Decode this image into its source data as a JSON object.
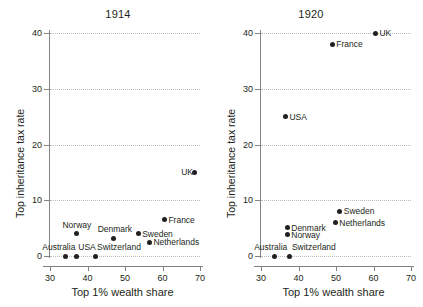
{
  "figure": {
    "xlabel": "Top 1% wealth share",
    "ylabel": "Top inheritance tax rate"
  },
  "chart_data": {
    "type": "scatter",
    "title": "",
    "xlabel": "Top 1% wealth share",
    "ylabel": "Top inheritance tax rate",
    "xlim": [
      28,
      71
    ],
    "ylim": [
      -1.5,
      41
    ],
    "xticks": [
      30,
      40,
      50,
      60,
      70
    ],
    "yticks": [
      0,
      10,
      20,
      30,
      40
    ],
    "grid": "horizontal-dotted",
    "legend": "none",
    "panels": [
      {
        "title": "1914",
        "points": [
          {
            "label": "Australia",
            "x": 34.0,
            "y": 0.0,
            "label_pos": "left-above"
          },
          {
            "label": "USA",
            "x": 37.0,
            "y": 0.0,
            "label_pos": "right-above"
          },
          {
            "label": "Switzerland",
            "x": 42.0,
            "y": 0.0,
            "label_pos": "right-above"
          },
          {
            "label": "Norway",
            "x": 37.0,
            "y": 4.0,
            "label_pos": "above"
          },
          {
            "label": "Denmark",
            "x": 47.0,
            "y": 3.2,
            "label_pos": "above"
          },
          {
            "label": "Sweden",
            "x": 53.5,
            "y": 4.0,
            "label_pos": "right"
          },
          {
            "label": "Netherlands",
            "x": 56.5,
            "y": 2.5,
            "label_pos": "right"
          },
          {
            "label": "France",
            "x": 60.5,
            "y": 6.5,
            "label_pos": "right"
          },
          {
            "label": "UK",
            "x": 68.5,
            "y": 15.0,
            "label_pos": "left"
          }
        ]
      },
      {
        "title": "1920",
        "points": [
          {
            "label": "Australia",
            "x": 33.7,
            "y": 0.0,
            "label_pos": "above"
          },
          {
            "label": "Switzerland",
            "x": 37.7,
            "y": 0.0,
            "label_pos": "right-above"
          },
          {
            "label": "Norway",
            "x": 37.0,
            "y": 3.8,
            "label_pos": "right"
          },
          {
            "label": "Denmark",
            "x": 37.0,
            "y": 5.1,
            "label_pos": "right"
          },
          {
            "label": "Netherlands",
            "x": 49.8,
            "y": 6.0,
            "label_pos": "right"
          },
          {
            "label": "Sweden",
            "x": 51.0,
            "y": 8.0,
            "label_pos": "right"
          },
          {
            "label": "USA",
            "x": 36.5,
            "y": 25.0,
            "label_pos": "right"
          },
          {
            "label": "France",
            "x": 49.0,
            "y": 38.0,
            "label_pos": "right"
          },
          {
            "label": "UK",
            "x": 60.5,
            "y": 40.0,
            "label_pos": "right"
          }
        ]
      }
    ]
  },
  "style": {
    "dot_color": "#231f20",
    "axis_color": "#808285",
    "grid_color": "#b9bbbd",
    "text_color": "#231f20",
    "background": "#ffffff"
  }
}
